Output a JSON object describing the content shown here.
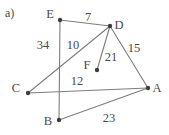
{
  "figure": {
    "part_label": "a)",
    "edge_color": "#7d7d7d",
    "vertex_color": "#3d3d3d",
    "text_color": "#4a4a4a",
    "background": "#ffffff",
    "width": 169,
    "height": 135
  },
  "chart_data": {
    "type": "diagram",
    "title": "a)",
    "nodes": [
      {
        "id": "E",
        "label": "E",
        "x": 60,
        "y": 20,
        "label_x": 50,
        "label_y": 14
      },
      {
        "id": "D",
        "label": "D",
        "x": 110,
        "y": 26,
        "label_x": 119,
        "label_y": 25
      },
      {
        "id": "C",
        "label": "C",
        "x": 28,
        "y": 93,
        "label_x": 16,
        "label_y": 88
      },
      {
        "id": "A",
        "label": "A",
        "x": 148,
        "y": 88,
        "label_x": 157,
        "label_y": 88
      },
      {
        "id": "B",
        "label": "B",
        "x": 59,
        "y": 120,
        "label_x": 48,
        "label_y": 121
      },
      {
        "id": "F",
        "label": "F",
        "x": 97,
        "y": 70,
        "label_x": 87,
        "label_y": 65
      }
    ],
    "edges": [
      {
        "from": "E",
        "to": "D",
        "weight": "7",
        "label_x": 88,
        "label_y": 17
      },
      {
        "from": "E",
        "to": "B",
        "weight": "34",
        "label_x": 43,
        "label_y": 45
      },
      {
        "from": "D",
        "to": "C",
        "weight": "10",
        "label_x": 73,
        "label_y": 45
      },
      {
        "from": "D",
        "to": "A",
        "weight": "15",
        "label_x": 134,
        "label_y": 48
      },
      {
        "from": "D",
        "to": "F",
        "weight": "21",
        "label_x": 111,
        "label_y": 57
      },
      {
        "from": "C",
        "to": "A",
        "weight": "12",
        "label_x": 77,
        "label_y": 81
      },
      {
        "from": "B",
        "to": "A",
        "weight": "23",
        "label_x": 109,
        "label_y": 118
      }
    ]
  }
}
